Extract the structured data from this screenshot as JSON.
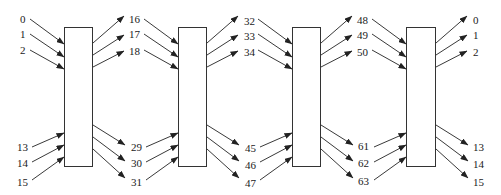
{
  "diagram": {
    "type": "multi-stage interconnection / permutation network",
    "stages": [
      {
        "id": "stage-1",
        "inputs_top": [
          "0",
          "1",
          "2"
        ],
        "inputs_bottom": [
          "13",
          "14",
          "15"
        ],
        "outputs_top": [
          "16",
          "17",
          "18"
        ],
        "outputs_bottom": [
          "29",
          "30",
          "31"
        ]
      },
      {
        "id": "stage-2",
        "inputs_top": [
          "16",
          "17",
          "18"
        ],
        "inputs_bottom": [
          "29",
          "30",
          "31"
        ],
        "outputs_top": [
          "32",
          "33",
          "34"
        ],
        "outputs_bottom": [
          "45",
          "46",
          "47"
        ]
      },
      {
        "id": "stage-3",
        "inputs_top": [
          "32",
          "33",
          "34"
        ],
        "inputs_bottom": [
          "45",
          "46",
          "47"
        ],
        "outputs_top": [
          "48",
          "49",
          "50"
        ],
        "outputs_bottom": [
          "61",
          "62",
          "63"
        ]
      },
      {
        "id": "stage-4",
        "inputs_top": [
          "48",
          "49",
          "50"
        ],
        "inputs_bottom": [
          "61",
          "62",
          "63"
        ],
        "outputs_top": [
          "0",
          "1",
          "2"
        ],
        "outputs_bottom": [
          "13",
          "14",
          "15"
        ]
      }
    ],
    "labels": {
      "col0_top": [
        "0",
        "1",
        "2"
      ],
      "col0_bottom": [
        "13",
        "14",
        "15"
      ],
      "col1_top": [
        "16",
        "17",
        "18"
      ],
      "col1_bottom": [
        "29",
        "30",
        "31"
      ],
      "col2_top": [
        "32",
        "33",
        "34"
      ],
      "col2_bottom": [
        "45",
        "46",
        "47"
      ],
      "col3_top": [
        "48",
        "49",
        "50"
      ],
      "col3_bottom": [
        "61",
        "62",
        "63"
      ],
      "col4_top": [
        "0",
        "1",
        "2"
      ],
      "col4_bottom": [
        "13",
        "14",
        "15"
      ]
    },
    "colors": {
      "line": "#222222",
      "box_border": "#333333",
      "background": "#ffffff",
      "text": "#1a1a1a"
    }
  }
}
